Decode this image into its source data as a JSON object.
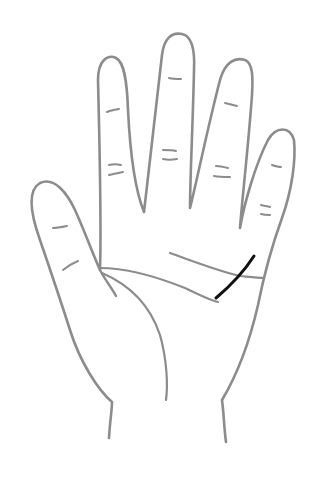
{
  "diagram": {
    "canvas": {
      "width": 318,
      "height": 477,
      "background": "#ffffff"
    },
    "colors": {
      "skin_fill": "#f7f7f7",
      "outline": "#8c8c8c",
      "crease": "#8c8c8c",
      "highlight_line": "#111111"
    },
    "stroke": {
      "outline_width": 2.6,
      "crease_width": 2.2,
      "highlight_width": 3
    },
    "lines": [
      {
        "name": "heart-line",
        "highlighted": false
      },
      {
        "name": "head-line",
        "highlighted": false
      },
      {
        "name": "life-line",
        "highlighted": false
      },
      {
        "name": "highlighted-line",
        "highlighted": true
      }
    ]
  }
}
